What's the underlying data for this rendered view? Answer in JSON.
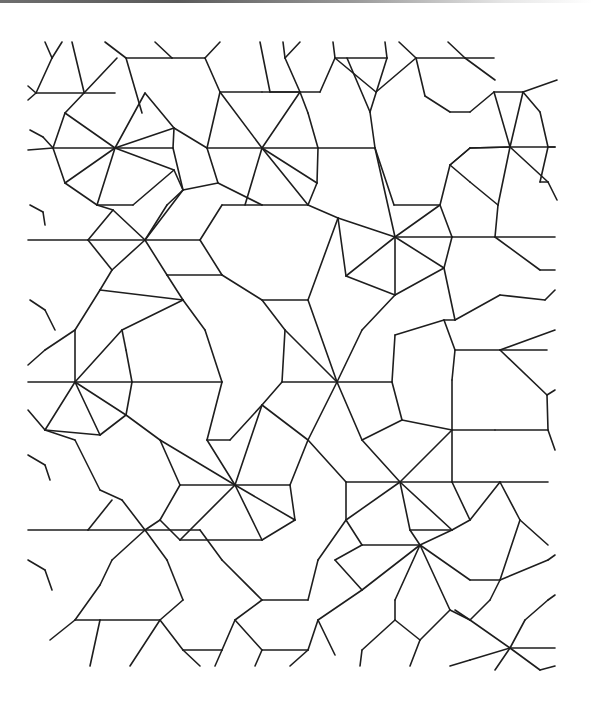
{
  "figure": {
    "caption": "Quasi-periodic tiling of heptagonal wheels, five-pointed stars and kite/rhombus fillers",
    "stroke_color": "#1e1e1e",
    "background": "#ffffff",
    "top_edge_artifact_color": "#6e6e6e"
  },
  "wheels": [
    {
      "cx": 115,
      "cy": 148,
      "r": 56
    },
    {
      "cx": 262,
      "cy": 148,
      "r": 56
    },
    {
      "cx": 395,
      "cy": 237,
      "r": 56
    },
    {
      "cx": 75,
      "cy": 382,
      "r": 56
    },
    {
      "cx": 235,
      "cy": 485,
      "r": 56
    },
    {
      "cx": 400,
      "cy": 482,
      "r": 56
    }
  ],
  "stars": [
    {
      "cx": 510,
      "cy": 147,
      "r": 56
    },
    {
      "cx": 145,
      "cy": 240,
      "r": 56
    },
    {
      "cx": 337,
      "cy": 382,
      "r": 56
    },
    {
      "cx": 145,
      "cy": 530,
      "r": 56
    },
    {
      "cx": 420,
      "cy": 545,
      "r": 56
    },
    {
      "cx": 510,
      "cy": 648,
      "r": 56
    }
  ],
  "segments": [
    [
      45,
      42,
      52,
      58
    ],
    [
      52,
      58,
      62,
      42
    ],
    [
      72,
      42,
      84,
      92
    ],
    [
      105,
      42,
      126,
      58
    ],
    [
      126,
      58,
      172,
      58
    ],
    [
      155,
      42,
      172,
      58
    ],
    [
      172,
      58,
      205,
      58
    ],
    [
      205,
      58,
      220,
      42
    ],
    [
      52,
      58,
      36,
      93
    ],
    [
      36,
      93,
      84,
      93
    ],
    [
      84,
      93,
      117,
      58
    ],
    [
      126,
      58,
      142,
      113
    ],
    [
      84,
      93,
      115,
      93
    ],
    [
      28,
      86,
      36,
      93
    ],
    [
      36,
      93,
      28,
      100
    ],
    [
      260,
      42,
      270,
      92
    ],
    [
      283,
      42,
      285,
      58
    ],
    [
      285,
      58,
      300,
      42
    ],
    [
      285,
      58,
      300,
      92
    ],
    [
      333,
      42,
      335,
      58
    ],
    [
      335,
      58,
      387,
      58
    ],
    [
      387,
      58,
      385,
      42
    ],
    [
      399,
      42,
      416,
      58
    ],
    [
      416,
      58,
      465,
      58
    ],
    [
      448,
      42,
      465,
      58
    ],
    [
      465,
      58,
      494,
      58
    ],
    [
      465,
      58,
      495,
      80
    ],
    [
      270,
      92,
      320,
      92
    ],
    [
      320,
      92,
      335,
      58
    ],
    [
      335,
      58,
      376,
      92
    ],
    [
      387,
      58,
      370,
      112
    ],
    [
      416,
      58,
      376,
      92
    ],
    [
      416,
      58,
      425,
      96
    ],
    [
      425,
      96,
      450,
      112
    ],
    [
      450,
      112,
      470,
      112
    ],
    [
      470,
      112,
      494,
      92
    ],
    [
      30,
      130,
      43,
      137
    ],
    [
      43,
      137,
      53,
      148
    ],
    [
      53,
      148,
      28,
      150
    ],
    [
      84,
      93,
      65,
      113
    ],
    [
      65,
      113,
      115,
      148
    ],
    [
      115,
      148,
      145,
      93
    ],
    [
      145,
      93,
      174,
      128
    ],
    [
      174,
      128,
      115,
      148
    ],
    [
      115,
      148,
      53,
      148
    ],
    [
      115,
      148,
      173,
      148
    ],
    [
      173,
      148,
      183,
      190
    ],
    [
      115,
      148,
      65,
      183
    ],
    [
      115,
      148,
      97,
      205
    ],
    [
      115,
      148,
      174,
      170
    ],
    [
      65,
      113,
      53,
      148
    ],
    [
      53,
      148,
      65,
      183
    ],
    [
      65,
      183,
      97,
      205
    ],
    [
      97,
      205,
      133,
      205
    ],
    [
      133,
      205,
      174,
      170
    ],
    [
      174,
      170,
      183,
      190
    ],
    [
      174,
      128,
      173,
      148
    ],
    [
      205,
      58,
      220,
      92
    ],
    [
      220,
      92,
      262,
      92
    ],
    [
      262,
      92,
      300,
      92
    ],
    [
      220,
      92,
      207,
      148
    ],
    [
      207,
      148,
      218,
      183
    ],
    [
      218,
      183,
      262,
      205
    ],
    [
      262,
      205,
      308,
      205
    ],
    [
      308,
      205,
      317,
      183
    ],
    [
      317,
      183,
      318,
      148
    ],
    [
      318,
      148,
      308,
      113
    ],
    [
      308,
      113,
      300,
      92
    ],
    [
      262,
      148,
      207,
      148
    ],
    [
      262,
      148,
      220,
      92
    ],
    [
      262,
      148,
      300,
      92
    ],
    [
      262,
      148,
      308,
      205
    ],
    [
      262,
      148,
      317,
      183
    ],
    [
      262,
      148,
      245,
      205
    ],
    [
      262,
      148,
      318,
      148
    ],
    [
      174,
      128,
      207,
      148
    ],
    [
      183,
      190,
      218,
      183
    ],
    [
      318,
      148,
      375,
      148
    ],
    [
      375,
      148,
      370,
      112
    ],
    [
      370,
      112,
      347,
      58
    ],
    [
      375,
      148,
      394,
      205
    ],
    [
      394,
      205,
      440,
      205
    ],
    [
      440,
      205,
      450,
      165
    ],
    [
      450,
      165,
      470,
      148
    ],
    [
      470,
      148,
      510,
      147
    ],
    [
      440,
      205,
      395,
      237
    ],
    [
      395,
      237,
      375,
      148
    ],
    [
      395,
      237,
      338,
      218
    ],
    [
      338,
      218,
      308,
      205
    ],
    [
      395,
      237,
      346,
      276
    ],
    [
      395,
      237,
      395,
      295
    ],
    [
      395,
      237,
      444,
      268
    ],
    [
      395,
      237,
      452,
      237
    ],
    [
      338,
      218,
      346,
      276
    ],
    [
      346,
      276,
      395,
      295
    ],
    [
      395,
      295,
      444,
      268
    ],
    [
      444,
      268,
      452,
      237
    ],
    [
      452,
      237,
      440,
      205
    ],
    [
      510,
      147,
      470,
      148
    ],
    [
      510,
      147,
      494,
      92
    ],
    [
      510,
      147,
      523,
      92
    ],
    [
      510,
      147,
      548,
      182
    ],
    [
      510,
      147,
      498,
      205
    ],
    [
      510,
      147,
      555,
      147
    ],
    [
      494,
      92,
      523,
      92
    ],
    [
      523,
      92,
      557,
      80
    ],
    [
      523,
      92,
      540,
      112
    ],
    [
      540,
      112,
      548,
      147
    ],
    [
      548,
      147,
      555,
      147
    ],
    [
      548,
      147,
      540,
      182
    ],
    [
      540,
      182,
      548,
      182
    ],
    [
      548,
      182,
      557,
      200
    ],
    [
      470,
      148,
      450,
      165
    ],
    [
      450,
      165,
      470,
      182
    ],
    [
      470,
      182,
      498,
      205
    ],
    [
      498,
      205,
      495,
      237
    ],
    [
      495,
      237,
      452,
      237
    ],
    [
      495,
      237,
      555,
      237
    ],
    [
      495,
      237,
      540,
      270
    ],
    [
      540,
      270,
      555,
      270
    ],
    [
      183,
      190,
      145,
      240
    ],
    [
      145,
      240,
      113,
      210
    ],
    [
      113,
      210,
      97,
      205
    ],
    [
      145,
      240,
      167,
      205
    ],
    [
      167,
      205,
      183,
      190
    ],
    [
      145,
      240,
      200,
      240
    ],
    [
      145,
      240,
      167,
      275
    ],
    [
      145,
      240,
      112,
      270
    ],
    [
      145,
      240,
      88,
      240
    ],
    [
      88,
      240,
      113,
      210
    ],
    [
      88,
      240,
      112,
      270
    ],
    [
      112,
      270,
      100,
      290
    ],
    [
      200,
      240,
      222,
      205
    ],
    [
      200,
      240,
      222,
      275
    ],
    [
      222,
      275,
      167,
      275
    ],
    [
      167,
      275,
      183,
      300
    ],
    [
      28,
      240,
      88,
      240
    ],
    [
      30,
      205,
      43,
      212
    ],
    [
      43,
      212,
      45,
      225
    ],
    [
      222,
      205,
      262,
      205
    ],
    [
      222,
      275,
      262,
      300
    ],
    [
      262,
      300,
      308,
      300
    ],
    [
      308,
      300,
      338,
      218
    ],
    [
      183,
      300,
      100,
      290
    ],
    [
      100,
      290,
      75,
      330
    ],
    [
      75,
      330,
      45,
      350
    ],
    [
      30,
      300,
      45,
      310
    ],
    [
      45,
      310,
      55,
      330
    ],
    [
      75,
      382,
      28,
      382
    ],
    [
      75,
      382,
      75,
      330
    ],
    [
      75,
      382,
      122,
      330
    ],
    [
      75,
      382,
      126,
      415
    ],
    [
      75,
      382,
      100,
      435
    ],
    [
      75,
      382,
      45,
      430
    ],
    [
      75,
      382,
      132,
      382
    ],
    [
      122,
      330,
      126,
      350
    ],
    [
      122,
      330,
      183,
      300
    ],
    [
      126,
      350,
      132,
      382
    ],
    [
      132,
      382,
      126,
      415
    ],
    [
      126,
      415,
      100,
      435
    ],
    [
      100,
      435,
      45,
      430
    ],
    [
      45,
      430,
      28,
      410
    ],
    [
      45,
      350,
      28,
      365
    ],
    [
      183,
      300,
      205,
      330
    ],
    [
      205,
      330,
      222,
      382
    ],
    [
      222,
      382,
      207,
      440
    ],
    [
      207,
      440,
      230,
      440
    ],
    [
      230,
      440,
      262,
      405
    ],
    [
      262,
      300,
      285,
      330
    ],
    [
      285,
      330,
      337,
      382
    ],
    [
      337,
      382,
      308,
      300
    ],
    [
      337,
      382,
      362,
      330
    ],
    [
      362,
      330,
      395,
      295
    ],
    [
      337,
      382,
      392,
      382
    ],
    [
      337,
      382,
      362,
      440
    ],
    [
      337,
      382,
      308,
      440
    ],
    [
      337,
      382,
      282,
      382
    ],
    [
      282,
      382,
      285,
      330
    ],
    [
      282,
      382,
      262,
      405
    ],
    [
      262,
      405,
      308,
      440
    ],
    [
      392,
      382,
      395,
      335
    ],
    [
      395,
      335,
      444,
      320
    ],
    [
      392,
      382,
      402,
      420
    ],
    [
      402,
      420,
      362,
      440
    ],
    [
      444,
      268,
      455,
      320
    ],
    [
      455,
      320,
      444,
      320
    ],
    [
      455,
      320,
      500,
      295
    ],
    [
      500,
      295,
      545,
      300
    ],
    [
      545,
      300,
      555,
      290
    ],
    [
      444,
      320,
      455,
      350
    ],
    [
      455,
      350,
      500,
      350
    ],
    [
      500,
      350,
      547,
      350
    ],
    [
      455,
      350,
      452,
      380
    ],
    [
      452,
      380,
      452,
      430
    ],
    [
      452,
      430,
      402,
      420
    ],
    [
      500,
      350,
      555,
      330
    ],
    [
      500,
      350,
      547,
      395
    ],
    [
      547,
      395,
      555,
      390
    ],
    [
      547,
      395,
      548,
      430
    ],
    [
      548,
      430,
      555,
      450
    ],
    [
      452,
      430,
      495,
      430
    ],
    [
      495,
      430,
      548,
      430
    ],
    [
      222,
      382,
      132,
      382
    ],
    [
      207,
      440,
      235,
      485
    ],
    [
      235,
      485,
      180,
      485
    ],
    [
      235,
      485,
      160,
      440
    ],
    [
      235,
      485,
      180,
      540
    ],
    [
      235,
      485,
      262,
      540
    ],
    [
      235,
      485,
      295,
      520
    ],
    [
      235,
      485,
      290,
      485
    ],
    [
      235,
      485,
      262,
      405
    ],
    [
      160,
      440,
      126,
      415
    ],
    [
      160,
      440,
      180,
      485
    ],
    [
      180,
      485,
      160,
      520
    ],
    [
      160,
      520,
      180,
      540
    ],
    [
      180,
      540,
      262,
      540
    ],
    [
      262,
      540,
      295,
      520
    ],
    [
      295,
      520,
      290,
      485
    ],
    [
      290,
      485,
      308,
      440
    ],
    [
      400,
      482,
      362,
      440
    ],
    [
      400,
      482,
      452,
      430
    ],
    [
      400,
      482,
      346,
      482
    ],
    [
      400,
      482,
      346,
      520
    ],
    [
      400,
      482,
      410,
      530
    ],
    [
      400,
      482,
      452,
      530
    ],
    [
      400,
      482,
      452,
      482
    ],
    [
      346,
      482,
      308,
      440
    ],
    [
      346,
      482,
      346,
      520
    ],
    [
      346,
      520,
      362,
      545
    ],
    [
      452,
      482,
      452,
      430
    ],
    [
      452,
      482,
      470,
      520
    ],
    [
      470,
      520,
      452,
      530
    ],
    [
      452,
      530,
      410,
      530
    ],
    [
      452,
      482,
      500,
      482
    ],
    [
      500,
      482,
      548,
      482
    ],
    [
      500,
      482,
      520,
      520
    ],
    [
      520,
      520,
      548,
      545
    ],
    [
      500,
      482,
      470,
      520
    ],
    [
      160,
      520,
      145,
      530
    ],
    [
      145,
      530,
      88,
      530
    ],
    [
      145,
      530,
      122,
      500
    ],
    [
      122,
      500,
      100,
      490
    ],
    [
      145,
      530,
      112,
      560
    ],
    [
      145,
      530,
      167,
      560
    ],
    [
      145,
      530,
      200,
      530
    ],
    [
      100,
      490,
      75,
      440
    ],
    [
      75,
      440,
      45,
      430
    ],
    [
      88,
      530,
      28,
      530
    ],
    [
      88,
      530,
      112,
      500
    ],
    [
      112,
      560,
      100,
      585
    ],
    [
      100,
      585,
      75,
      620
    ],
    [
      167,
      560,
      183,
      600
    ],
    [
      28,
      455,
      45,
      465
    ],
    [
      45,
      465,
      50,
      480
    ],
    [
      28,
      560,
      45,
      570
    ],
    [
      45,
      570,
      52,
      590
    ],
    [
      200,
      530,
      222,
      560
    ],
    [
      222,
      560,
      262,
      600
    ],
    [
      262,
      600,
      308,
      600
    ],
    [
      308,
      600,
      318,
      560
    ],
    [
      318,
      560,
      346,
      520
    ],
    [
      362,
      545,
      420,
      545
    ],
    [
      420,
      545,
      410,
      530
    ],
    [
      420,
      545,
      452,
      530
    ],
    [
      420,
      545,
      470,
      580
    ],
    [
      420,
      545,
      450,
      610
    ],
    [
      420,
      545,
      362,
      590
    ],
    [
      420,
      545,
      395,
      600
    ],
    [
      362,
      545,
      335,
      560
    ],
    [
      335,
      560,
      362,
      590
    ],
    [
      470,
      580,
      500,
      580
    ],
    [
      500,
      580,
      520,
      520
    ],
    [
      500,
      580,
      548,
      560
    ],
    [
      548,
      560,
      555,
      555
    ],
    [
      183,
      600,
      160,
      620
    ],
    [
      160,
      620,
      100,
      620
    ],
    [
      100,
      620,
      75,
      620
    ],
    [
      75,
      620,
      50,
      640
    ],
    [
      160,
      620,
      183,
      650
    ],
    [
      183,
      650,
      222,
      650
    ],
    [
      222,
      650,
      235,
      620
    ],
    [
      235,
      620,
      262,
      600
    ],
    [
      235,
      620,
      262,
      650
    ],
    [
      262,
      650,
      308,
      650
    ],
    [
      308,
      650,
      318,
      620
    ],
    [
      318,
      620,
      362,
      590
    ],
    [
      318,
      620,
      335,
      655
    ],
    [
      395,
      600,
      395,
      620
    ],
    [
      395,
      620,
      362,
      650
    ],
    [
      395,
      620,
      420,
      640
    ],
    [
      420,
      640,
      450,
      610
    ],
    [
      450,
      610,
      470,
      620
    ],
    [
      470,
      620,
      510,
      648
    ],
    [
      510,
      648,
      555,
      648
    ],
    [
      510,
      648,
      470,
      660
    ],
    [
      510,
      648,
      525,
      620
    ],
    [
      525,
      620,
      548,
      600
    ],
    [
      548,
      600,
      555,
      595
    ],
    [
      510,
      648,
      540,
      670
    ],
    [
      510,
      648,
      495,
      670
    ],
    [
      470,
      620,
      455,
      610
    ],
    [
      470,
      620,
      490,
      600
    ],
    [
      490,
      600,
      500,
      580
    ],
    [
      100,
      620,
      90,
      666
    ],
    [
      160,
      620,
      130,
      666
    ],
    [
      183,
      650,
      200,
      666
    ],
    [
      222,
      650,
      215,
      666
    ],
    [
      262,
      650,
      255,
      666
    ],
    [
      308,
      650,
      290,
      666
    ],
    [
      362,
      650,
      360,
      666
    ],
    [
      420,
      640,
      410,
      666
    ],
    [
      450,
      666,
      470,
      660
    ],
    [
      540,
      670,
      555,
      666
    ]
  ]
}
